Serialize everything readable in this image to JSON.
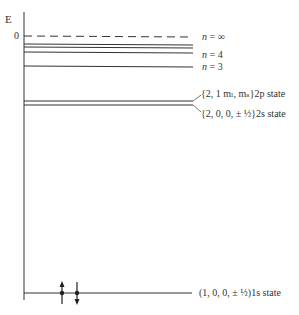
{
  "axis": {
    "label": "E",
    "zero_label": "0"
  },
  "levels": {
    "n_inf": {
      "label_n": "n",
      "label_rest": " = ∞"
    },
    "n4": {
      "label_n": "n",
      "label_rest": " = 4"
    },
    "n3": {
      "label_n": "n",
      "label_rest": " = 3"
    },
    "p2": {
      "text": "{2, 1 mₗ, mₛ}2p state"
    },
    "s2": {
      "text": "{2, 0, 0, ± ½}2s state"
    },
    "s1": {
      "text": "(1, 0, 0, ± ½)1s state"
    }
  },
  "electrons": [
    {
      "spin": "up"
    },
    {
      "spin": "down"
    }
  ]
}
